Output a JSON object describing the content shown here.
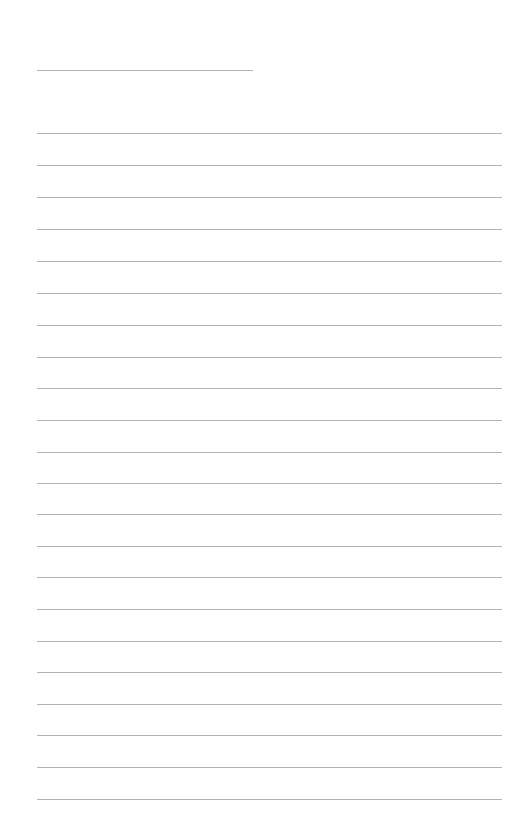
{
  "page": {
    "type": "lined-paper",
    "background_color": "#ffffff",
    "rule_color": "#b3b3b3",
    "title_line": {
      "y": 70,
      "x_start": 37,
      "x_end": 253
    },
    "writing_lines": {
      "count": 22,
      "x_start": 37,
      "x_end": 502,
      "y_positions": [
        133,
        165,
        197,
        229,
        261,
        293,
        325,
        357,
        388,
        420,
        452,
        483,
        514,
        546,
        577,
        609,
        641,
        672,
        704,
        735,
        767,
        799
      ]
    }
  }
}
